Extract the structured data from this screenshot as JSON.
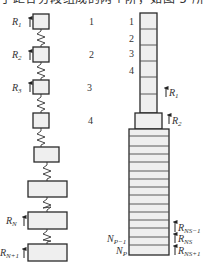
{
  "caption": "于距各分段组成的两个阶，如图 5 所",
  "left_model": {
    "title": "lumped spring-mass model",
    "blocks": [
      {
        "index": "1",
        "label": "R",
        "sub": "1"
      },
      {
        "index": "2",
        "label": "R",
        "sub": "2"
      },
      {
        "index": "3",
        "label": "R",
        "sub": "3"
      },
      {
        "index": "4",
        "label": "",
        "sub": ""
      },
      {
        "index": "",
        "label": "",
        "sub": ""
      },
      {
        "index": "",
        "label": "",
        "sub": ""
      },
      {
        "index": "",
        "label": "R",
        "sub": "N"
      },
      {
        "index": "",
        "label": "R",
        "sub": "N+1"
      }
    ]
  },
  "right_model": {
    "title": "segmented column model",
    "segment_numbers": [
      "1",
      "2",
      "3",
      "4"
    ],
    "labels": {
      "r1": {
        "main": "R",
        "sub": "1"
      },
      "r2": {
        "main": "R",
        "sub": "2"
      },
      "rns_minus": {
        "main": "R",
        "sub": "NS−1"
      },
      "rns": {
        "main": "R",
        "sub": "NS"
      },
      "rns_plus": {
        "main": "R",
        "sub": "NS+1"
      },
      "np_minus": {
        "main": "N",
        "sub": "P−1"
      },
      "np": {
        "main": "N",
        "sub": "P"
      }
    }
  },
  "colors": {
    "block_fill": "#efefef",
    "stroke": "#2a2a2a",
    "divider": "#4a4a4a"
  }
}
